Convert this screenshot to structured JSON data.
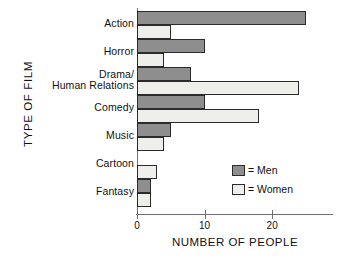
{
  "chart_data": {
    "type": "bar",
    "orientation": "horizontal",
    "title": "",
    "xlabel": "NUMBER OF PEOPLE",
    "ylabel": "TYPE OF FILM",
    "categories": [
      "Action",
      "Horror",
      "Drama/\nHuman Relations",
      "Comedy",
      "Music",
      "Cartoon",
      "Fantasy"
    ],
    "series": [
      {
        "name": "Men",
        "color": "#8e8e8e",
        "values": [
          25,
          10,
          8,
          10,
          5,
          0,
          2
        ]
      },
      {
        "name": "Women",
        "color": "#eeeeea",
        "values": [
          5,
          4,
          24,
          18,
          4,
          3,
          2
        ]
      }
    ],
    "xlim": [
      0,
      29
    ],
    "xticks": [
      0,
      10,
      20
    ],
    "xtick_labels": [
      "0",
      "10",
      "20"
    ],
    "grid": false,
    "legend_position": "inside-bottom-right"
  },
  "legend": {
    "entries": [
      {
        "label": "= Men"
      },
      {
        "label": "= Women"
      }
    ]
  }
}
